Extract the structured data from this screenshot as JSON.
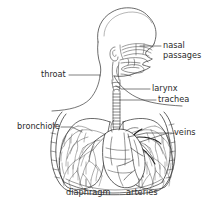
{
  "diagram": {
    "type": "anatomical-line-diagram",
    "background_color": "#ffffff",
    "line_color": "#3a3a3a",
    "text_color": "#2b2b2b",
    "view": "side profile of head and neck with frontal view of chest, lungs and heart",
    "labels": [
      {
        "id": "nasal-passages",
        "text": "nasal\npassages",
        "line1": "nasal",
        "line2": "passages",
        "x": 163,
        "y": 41,
        "leader_from": [
          161,
          46
        ],
        "leader_to": [
          140,
          46
        ]
      },
      {
        "id": "throat",
        "text": "throat",
        "line1": "throat",
        "line2": "",
        "x": 41,
        "y": 70,
        "leader_from": [
          69,
          75
        ],
        "leader_to": [
          97,
          75
        ]
      },
      {
        "id": "larynx",
        "text": "larynx",
        "line1": "larynx",
        "line2": "",
        "x": 152,
        "y": 84,
        "leader_from": [
          150,
          89
        ],
        "leader_to": [
          120,
          89
        ]
      },
      {
        "id": "trachea",
        "text": "trachea",
        "line1": "trachea",
        "line2": "",
        "x": 158,
        "y": 95,
        "leader_from": [
          156,
          100
        ],
        "leader_to": [
          118,
          100
        ]
      },
      {
        "id": "bronchiole",
        "text": "bronchiole",
        "line1": "bronchiole",
        "line2": "",
        "x": 17,
        "y": 122,
        "leader_from": [
          61,
          127
        ],
        "leader_to": [
          80,
          131
        ]
      },
      {
        "id": "veins",
        "text": "veins",
        "line1": "veins",
        "line2": "",
        "x": 174,
        "y": 128,
        "leader_from": [
          172,
          133
        ],
        "leader_to": [
          130,
          137
        ]
      },
      {
        "id": "diaphragm",
        "text": "diaphragm",
        "line1": "diaphragm",
        "line2": "",
        "x": 66,
        "y": 188,
        "leader_from": [
          86,
          178
        ],
        "leader_to": [
          86,
          186
        ]
      },
      {
        "id": "arteries",
        "text": "arteries",
        "line1": "arteries",
        "line2": "",
        "x": 126,
        "y": 188,
        "leader_from": [
          139,
          178
        ],
        "leader_to": [
          139,
          186
        ]
      }
    ]
  }
}
